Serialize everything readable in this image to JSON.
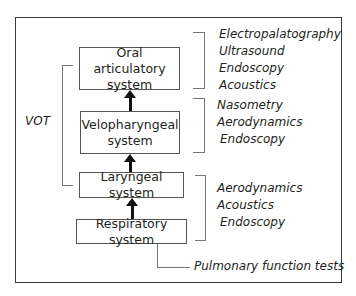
{
  "diagram": {
    "systems": [
      {
        "id": "oral",
        "line1": "Oral articulatory",
        "line2": "system"
      },
      {
        "id": "velopharyngeal",
        "line1": "Velopharyngeal",
        "line2": "system"
      },
      {
        "id": "laryngeal",
        "line1": "Laryngeal system"
      },
      {
        "id": "respiratory",
        "line1": "Respiratory system"
      }
    ],
    "vot_label": "VOT",
    "methods": {
      "oral": [
        "Electropalatography",
        "Ultrasound",
        "Endoscopy",
        "Acoustics"
      ],
      "velopharyngeal": [
        "Nasometry",
        "Aerodynamics",
        "Endoscopy"
      ],
      "laryngeal_respiratory": [
        "Aerodynamics",
        "Acoustics",
        "Endoscopy"
      ],
      "respiratory": "Pulmonary function tests"
    }
  }
}
